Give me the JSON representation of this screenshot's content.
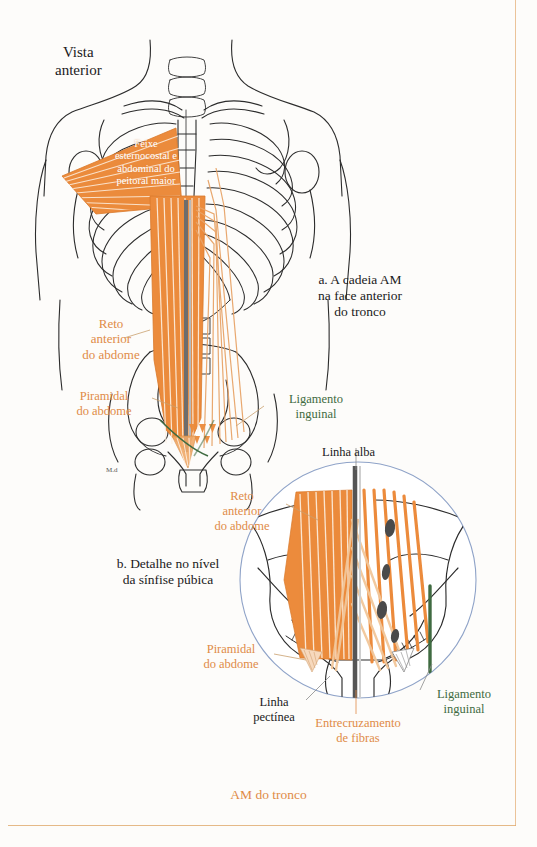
{
  "page": {
    "footer_caption": "AM do tronco",
    "accent_color": "#e08b47",
    "green_color": "#3f6b41",
    "ink_color": "#1a1a1a"
  },
  "figure_a": {
    "view_label": "Vista\nanterior",
    "caption": "a. A cadeia AM\nna face anterior\ndo tronco",
    "labels": {
      "pectoral": "Feixe\nesternocostal e\nabdominal do\npeitoral maior",
      "rectus": "Reto\nanterior\ndo abdome",
      "pyramidalis": "Piramidal\ndo abdome",
      "inguinal_ligament": "Ligamento\ninguinal"
    }
  },
  "figure_b": {
    "caption": "b. Detalhe no nível\nda sínfise púbica",
    "labels": {
      "linea_alba": "Linha alba",
      "rectus": "Reto\nanterior\ndo abdome",
      "pyramidalis": "Piramidal\ndo abdome",
      "pectineal_line": "Linha\npectínea",
      "fiber_crossing": "Entrecruzamento\nde fibras",
      "inguinal_ligament": "Ligamento\ninguinal"
    }
  }
}
